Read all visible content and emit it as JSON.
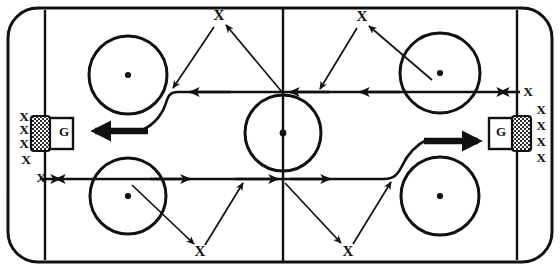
{
  "diagram": {
    "type": "ice-hockey-drill",
    "colors": {
      "ink": "#111111",
      "ice": "#ffffff"
    },
    "rink": {
      "left": 8,
      "top": 8,
      "right": 552,
      "bottom": 262,
      "corner_radius": 30,
      "goal_line_left_x": 45,
      "goal_line_right_x": 517
    },
    "goalies": [
      {
        "id": "left-goalie",
        "label": "G",
        "x": 64,
        "y": 133
      },
      {
        "id": "right-goalie",
        "label": "G",
        "x": 514,
        "y": 133
      }
    ],
    "player_marks": [
      {
        "id": "left-queue-1",
        "label": "X",
        "x": 24,
        "y": 118
      },
      {
        "id": "left-queue-2",
        "label": "X",
        "x": 24,
        "y": 131
      },
      {
        "id": "left-queue-3",
        "label": "X",
        "x": 24,
        "y": 145
      },
      {
        "id": "left-queue-4",
        "label": "X",
        "x": 26,
        "y": 160
      },
      {
        "id": "left-queue-5",
        "label": "X",
        "x": 41,
        "y": 179
      },
      {
        "id": "right-queue-1",
        "label": "X",
        "x": 528,
        "y": 93
      },
      {
        "id": "right-queue-2",
        "label": "X",
        "x": 540,
        "y": 111
      },
      {
        "id": "right-queue-3",
        "label": "X",
        "x": 540,
        "y": 127
      },
      {
        "id": "right-queue-4",
        "label": "X",
        "x": 540,
        "y": 143
      },
      {
        "id": "right-queue-5",
        "label": "X",
        "x": 540,
        "y": 158
      },
      {
        "id": "target-top-left",
        "label": "X",
        "x": 218,
        "y": 17
      },
      {
        "id": "target-top-right",
        "label": "X",
        "x": 361,
        "y": 18
      },
      {
        "id": "target-bottom-left",
        "label": "X",
        "x": 200,
        "y": 254
      },
      {
        "id": "target-bottom-right",
        "label": "X",
        "x": 348,
        "y": 254
      }
    ],
    "faceoff_circles": [
      {
        "id": "circle-top-left",
        "cx": 128,
        "cy": 75,
        "r": 39
      },
      {
        "id": "circle-bottom-left",
        "cx": 128,
        "cy": 196,
        "r": 38
      },
      {
        "id": "circle-top-right",
        "cx": 440,
        "cy": 73,
        "r": 40
      },
      {
        "id": "circle-bottom-right",
        "cx": 440,
        "cy": 196,
        "r": 39
      },
      {
        "id": "circle-center",
        "cx": 283,
        "cy": 133,
        "r": 38
      }
    ],
    "legend": {
      "x_meaning": "skater",
      "g_meaning": "goaltender",
      "thin_arrow": "pass",
      "thick_arrow": "shot",
      "curved_line": "skating path"
    }
  }
}
